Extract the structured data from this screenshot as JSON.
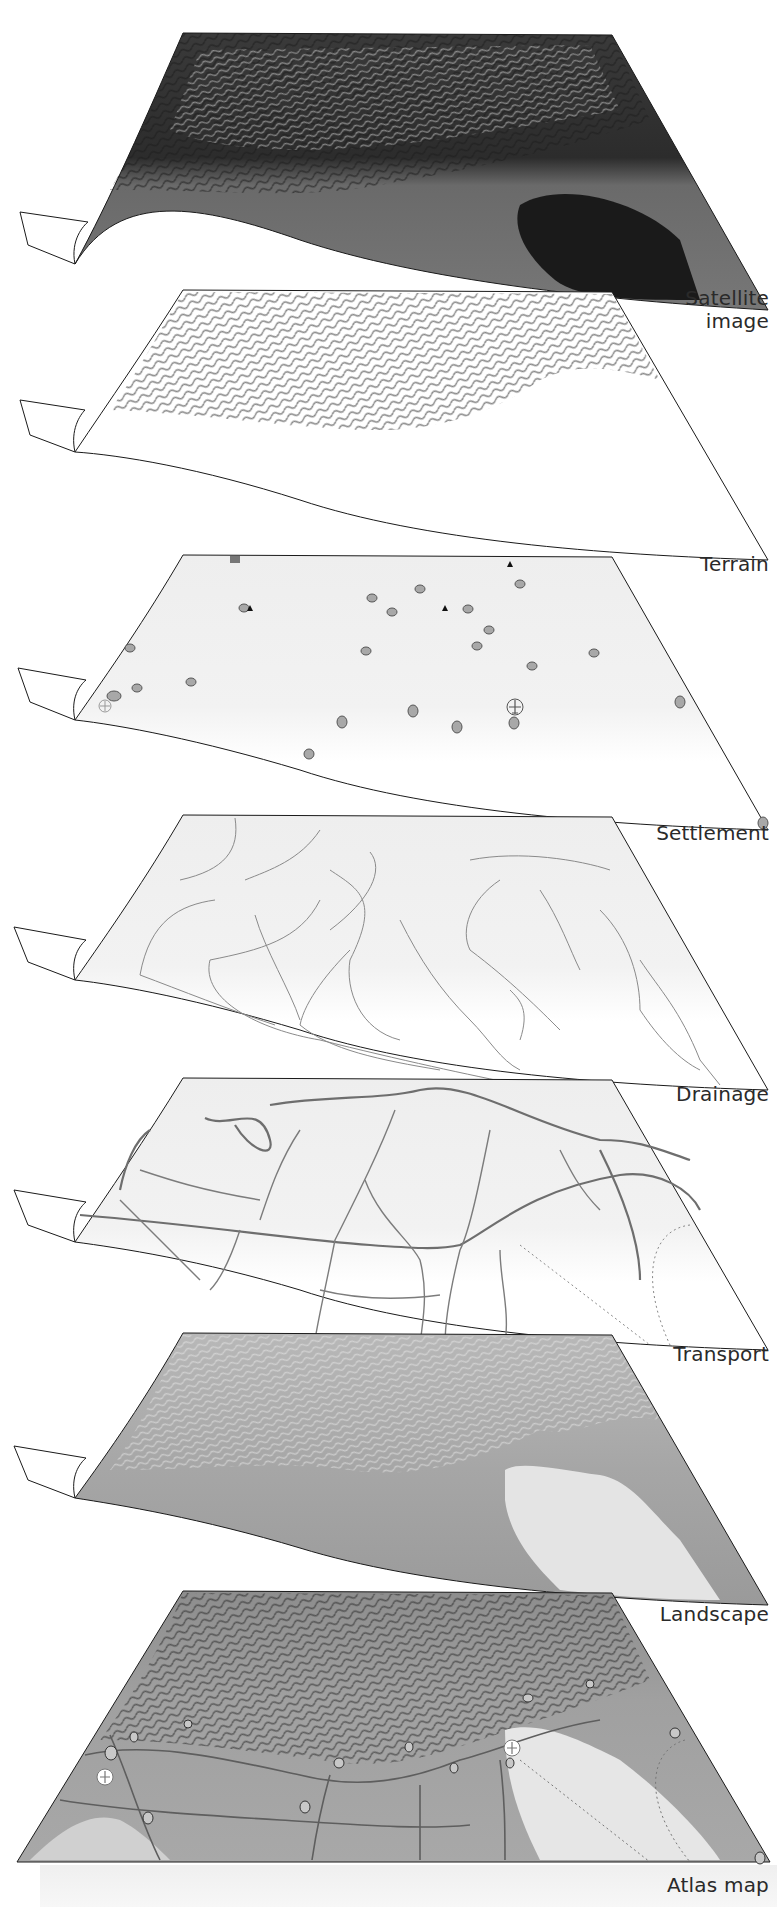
{
  "figure": {
    "type": "stacked-map-layers"
  },
  "layers": [
    {
      "label": "Satellite image",
      "label_lines": [
        "Satellite",
        "image"
      ],
      "style": "satellite",
      "fill": "#5a5a5a"
    },
    {
      "label": "Terrain",
      "label_lines": [
        "Terrain"
      ],
      "style": "hillshade",
      "fill": "#ffffff"
    },
    {
      "label": "Settlement",
      "label_lines": [
        "Settlement"
      ],
      "style": "points",
      "fill": "#f0f0f0"
    },
    {
      "label": "Drainage",
      "label_lines": [
        "Drainage"
      ],
      "style": "rivers",
      "fill": "#f0f0f0"
    },
    {
      "label": "Transport",
      "label_lines": [
        "Transport"
      ],
      "style": "roads",
      "fill": "#eeeeee"
    },
    {
      "label": "Landscape",
      "label_lines": [
        "Landscape"
      ],
      "style": "landcover",
      "fill": "#a9a9a9"
    },
    {
      "label": "Atlas map",
      "label_lines": [
        "Atlas map"
      ],
      "style": "composite",
      "fill": "#9c9c9c"
    }
  ],
  "colors": {
    "outline": "#1a1a1a",
    "sea_dark": "#1e1e1e",
    "sea_light": "#e6e6e6",
    "settlement_dot": "#a8a8a8",
    "river_line": "#8a8a8a",
    "road_line": "#6e6e6e"
  }
}
